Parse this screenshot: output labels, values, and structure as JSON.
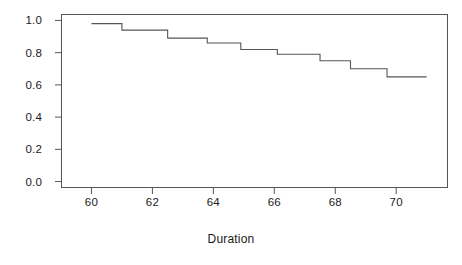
{
  "chart_data": {
    "type": "line",
    "subtype": "step",
    "title": "",
    "xlabel": "Duration",
    "ylabel": "",
    "xlim": [
      59.0,
      71.7
    ],
    "ylim": [
      -0.04,
      1.04
    ],
    "grid": false,
    "legend": "none",
    "x_ticks": [
      60,
      62,
      64,
      66,
      68,
      70
    ],
    "x_tick_labels": [
      "60",
      "62",
      "64",
      "66",
      "68",
      "70"
    ],
    "y_ticks": [
      0.0,
      0.2,
      0.4,
      0.6,
      0.8,
      1.0
    ],
    "y_tick_labels": [
      "0.0",
      "0.2",
      "0.4",
      "0.6",
      "0.8",
      "1.0"
    ],
    "series": [
      {
        "name": "survival",
        "color": "#555555",
        "x": [
          60.0,
          61.0,
          61.0,
          62.5,
          62.5,
          63.8,
          63.8,
          64.9,
          64.9,
          66.1,
          66.1,
          67.5,
          67.5,
          68.5,
          68.5,
          69.7,
          69.7,
          71.0
        ],
        "y": [
          0.98,
          0.98,
          0.94,
          0.94,
          0.89,
          0.89,
          0.86,
          0.86,
          0.82,
          0.82,
          0.79,
          0.79,
          0.75,
          0.75,
          0.7,
          0.7,
          0.65,
          0.65
        ],
        "steps": [
          {
            "duration": 60.0,
            "survival": 0.98
          },
          {
            "duration": 61.0,
            "survival": 0.94
          },
          {
            "duration": 62.5,
            "survival": 0.89
          },
          {
            "duration": 63.8,
            "survival": 0.86
          },
          {
            "duration": 64.9,
            "survival": 0.82
          },
          {
            "duration": 66.1,
            "survival": 0.79
          },
          {
            "duration": 67.5,
            "survival": 0.75
          },
          {
            "duration": 68.5,
            "survival": 0.7
          },
          {
            "duration": 69.7,
            "survival": 0.65
          },
          {
            "duration": 71.0,
            "survival": 0.65
          }
        ]
      }
    ]
  },
  "axis": {
    "x_title": "Duration"
  },
  "style": {
    "frame_color": "#555555",
    "line_color": "#555555",
    "text_color": "#1a1a1a",
    "background": "#ffffff"
  }
}
